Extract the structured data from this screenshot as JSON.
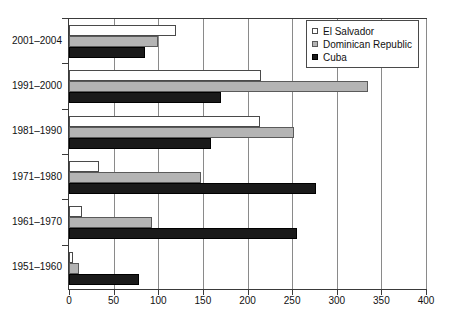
{
  "chart_data": {
    "type": "bar",
    "orientation": "horizontal",
    "title": "",
    "xlabel": "",
    "ylabel": "",
    "xlim": [
      0,
      400
    ],
    "xticks": [
      0,
      50,
      100,
      150,
      200,
      250,
      300,
      350,
      400
    ],
    "xtick_labels": [
      "0",
      "50",
      "100",
      "150",
      "200",
      "250",
      "300",
      "350",
      "400"
    ],
    "grid": true,
    "grid_axis": "x",
    "legend_position": "top-right",
    "categories": [
      "2001–2004",
      "1991–2000",
      "1981–1990",
      "1971–1980",
      "1961–1970",
      "1951–1960"
    ],
    "series": [
      {
        "name": "El Salvador",
        "color": "#ffffff",
        "values": [
          120,
          215,
          214,
          34,
          15,
          5
        ]
      },
      {
        "name": "Dominican Republic",
        "color": "#b4b4b4",
        "values": [
          100,
          335,
          252,
          148,
          93,
          11
        ]
      },
      {
        "name": "Cuba",
        "color": "#1a1a1a",
        "values": [
          85,
          170,
          159,
          277,
          256,
          78
        ]
      }
    ]
  },
  "legend": {
    "entries": [
      {
        "label": "El Salvador",
        "swatch": "hollow-square-swatch"
      },
      {
        "label": "Dominican Republic",
        "swatch": "gray-square-swatch"
      },
      {
        "label": "Cuba",
        "swatch": "black-square-swatch"
      }
    ]
  }
}
